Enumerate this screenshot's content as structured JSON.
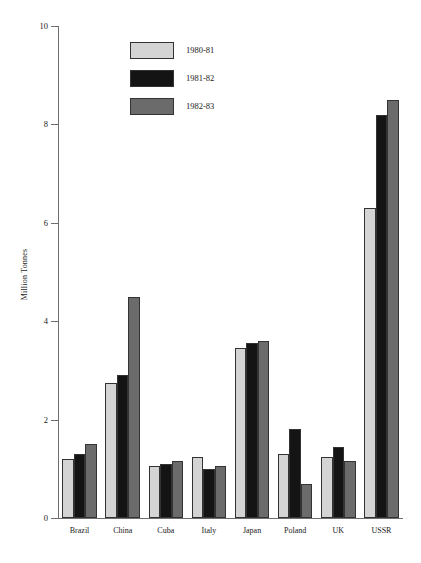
{
  "chart_data": {
    "type": "bar",
    "title": "",
    "xlabel": "",
    "ylabel": "Million Tonnes",
    "ylim": [
      0,
      10
    ],
    "yticks": [
      0,
      2,
      4,
      6,
      8,
      10
    ],
    "ytick_labels": [
      "0",
      "2",
      "4",
      "6",
      "8",
      "10"
    ],
    "grid": false,
    "legend_position": "upper-left-inside",
    "categories": [
      "Brazil",
      "China",
      "Cuba",
      "Italy",
      "Japan",
      "Poland",
      "UK",
      "USSR"
    ],
    "series": [
      {
        "name": "1980-81",
        "color": "#d4d4d4",
        "values": [
          1.2,
          2.75,
          1.05,
          1.25,
          3.45,
          1.3,
          1.25,
          6.3
        ]
      },
      {
        "name": "1981-82",
        "color": "#141414",
        "values": [
          1.3,
          2.9,
          1.1,
          1.0,
          3.55,
          1.8,
          1.45,
          8.2
        ]
      },
      {
        "name": "1982-83",
        "color": "#6b6b6b",
        "values": [
          1.5,
          4.5,
          1.15,
          1.05,
          3.6,
          0.7,
          1.15,
          8.5
        ]
      }
    ]
  },
  "colors": {
    "axis": "#6e6e6e",
    "bar_outline": "#333333",
    "text": "#1a1a1a",
    "background": "#ffffff"
  }
}
